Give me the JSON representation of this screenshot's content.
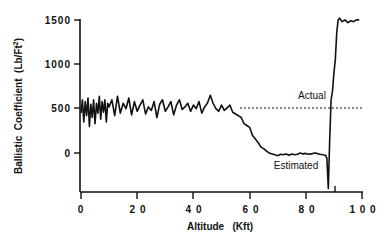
{
  "chart_data": {
    "type": "line",
    "title": "",
    "xlabel": "Altitude   (Kft)",
    "ylabel": "Ballistic  Coefficient  (Lb/Ft²)",
    "xlim": [
      0,
      100
    ],
    "ylim": [
      -400,
      1500
    ],
    "x_ticks": [
      0,
      20,
      40,
      60,
      80,
      100
    ],
    "x_tick_labels": [
      "0",
      "2 0",
      "4 0",
      "6 0",
      "8 0",
      "1 0 0"
    ],
    "y_ticks": [
      1500,
      1000,
      500,
      0
    ],
    "y_tick_labels": [
      "1500",
      "1000",
      "500",
      "0"
    ],
    "grid": false,
    "legend": "none (inline annotations)",
    "annotations": [
      {
        "text": "Actual",
        "x": 83,
        "y": 590
      },
      {
        "text": "Estimated",
        "x": 75,
        "y": -150
      }
    ],
    "series": [
      {
        "name": "Actual",
        "style": "dotted",
        "x": [
          0,
          100
        ],
        "y": [
          500,
          500
        ]
      },
      {
        "name": "Estimated",
        "style": "solid",
        "x": [
          0,
          0.5,
          1,
          1.5,
          2,
          2.5,
          3,
          3.5,
          4,
          4.5,
          5,
          5.5,
          6,
          6.5,
          7,
          7.5,
          8,
          8.5,
          9,
          9.5,
          10,
          11,
          12,
          13,
          14,
          15,
          16,
          17,
          18,
          19,
          20,
          21,
          22,
          23,
          24,
          25,
          26,
          27,
          28,
          29,
          30,
          31,
          32,
          33,
          34,
          35,
          36,
          37,
          38,
          39,
          40,
          41,
          42,
          43,
          44,
          45,
          46,
          47,
          48,
          49,
          50,
          51,
          52,
          53,
          54,
          55,
          56,
          57,
          58,
          59,
          60,
          61,
          62,
          63,
          64,
          65,
          66,
          67,
          68,
          69,
          70,
          71,
          72,
          73,
          74,
          75,
          76,
          77,
          78,
          79,
          80,
          81,
          82,
          83,
          84,
          85,
          86,
          87,
          87.5,
          88,
          88.5,
          89,
          89.5,
          90,
          90.5,
          91,
          91.5,
          92,
          93,
          94,
          95,
          96,
          97,
          98,
          99
        ],
        "y": [
          450,
          600,
          350,
          580,
          420,
          620,
          300,
          550,
          400,
          600,
          330,
          560,
          450,
          640,
          380,
          580,
          460,
          600,
          350,
          560,
          520,
          600,
          420,
          640,
          450,
          560,
          500,
          620,
          430,
          580,
          470,
          540,
          600,
          440,
          520,
          480,
          580,
          400,
          550,
          600,
          470,
          520,
          580,
          430,
          540,
          600,
          490,
          520,
          560,
          470,
          540,
          500,
          580,
          450,
          520,
          560,
          650,
          560,
          500,
          470,
          540,
          480,
          510,
          540,
          460,
          440,
          420,
          400,
          330,
          310,
          290,
          200,
          160,
          120,
          70,
          50,
          20,
          0,
          -10,
          -20,
          -30,
          -15,
          -20,
          -10,
          -25,
          -10,
          -20,
          -15,
          0,
          -10,
          -5,
          -15,
          -10,
          0,
          -5,
          -15,
          -20,
          -25,
          -60,
          -400,
          150,
          600,
          700,
          900,
          1050,
          1350,
          1500,
          1520,
          1480,
          1500,
          1470,
          1490,
          1480,
          1500,
          1500
        ]
      }
    ]
  },
  "labels": {
    "y_axis_title": "Ballistic  Coefficient  (Lb/Ft",
    "y_axis_sup": "2",
    "y_axis_close": ")",
    "x_axis_title": "Altitude   (Kft)",
    "actual": "Actual",
    "estimated": "Estimated",
    "yt0": "1500",
    "yt1": "1000",
    "yt2": "500",
    "yt3": "0",
    "xt0": "0",
    "xt1": "2 0",
    "xt2": "4 0",
    "xt3": "6 0",
    "xt4": "8 0",
    "xt5": "1 0 0"
  }
}
